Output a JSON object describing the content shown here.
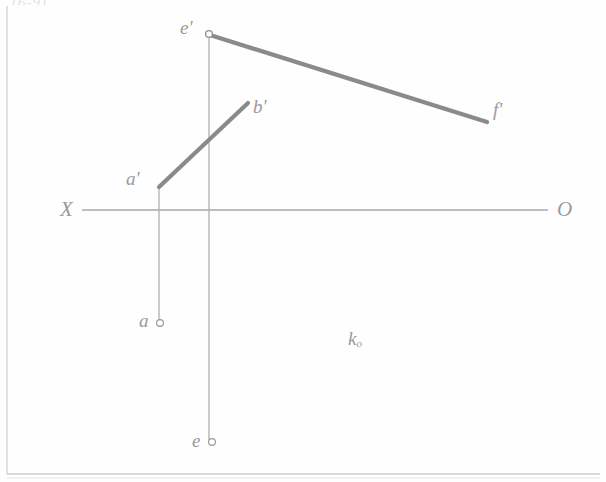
{
  "drawing": {
    "title_fragment": "(6-9),",
    "background": "#fefefe",
    "ink_thin": "#a8a8a8",
    "ink_thick": "#8a8a8a",
    "label_color": "#9a9a9a",
    "border_color": "#cfcfcf"
  },
  "labels": {
    "x_axis_left": "X",
    "x_axis_right": "O",
    "a_prime": "a'",
    "b_prime": "b'",
    "e_prime": "e'",
    "f_prime": "f'",
    "a_point": "a",
    "e_point": "e",
    "k_plane": "k",
    "k_subscript": "o"
  },
  "geometry": {
    "ground_line": {
      "x1": 82,
      "y1": 210,
      "x2": 548,
      "y2": 210
    },
    "segments": [
      {
        "name": "a'b'",
        "x1": 159,
        "y1": 186,
        "x2": 248,
        "y2": 103,
        "width": 4.2
      },
      {
        "name": "e'f'",
        "x1": 209,
        "y1": 35,
        "x2": 487,
        "y2": 122,
        "width": 4.2
      }
    ],
    "projection_lines": [
      {
        "name": "a'-a",
        "x1": 159,
        "y1": 186,
        "x2": 159,
        "y2": 322,
        "width": 1
      },
      {
        "name": "e'-e",
        "x1": 209,
        "y1": 35,
        "x2": 209,
        "y2": 441,
        "width": 1
      }
    ],
    "points": [
      {
        "name": "e'",
        "cx": 209,
        "cy": 34,
        "r": 3.5
      },
      {
        "name": "a",
        "cx": 160,
        "cy": 323,
        "r": 3.5
      },
      {
        "name": "e",
        "cx": 212,
        "cy": 442,
        "r": 3.5
      }
    ],
    "border": {
      "left_x": 7,
      "top_y": 6,
      "bottom_y": 474,
      "right_x": 600
    }
  }
}
